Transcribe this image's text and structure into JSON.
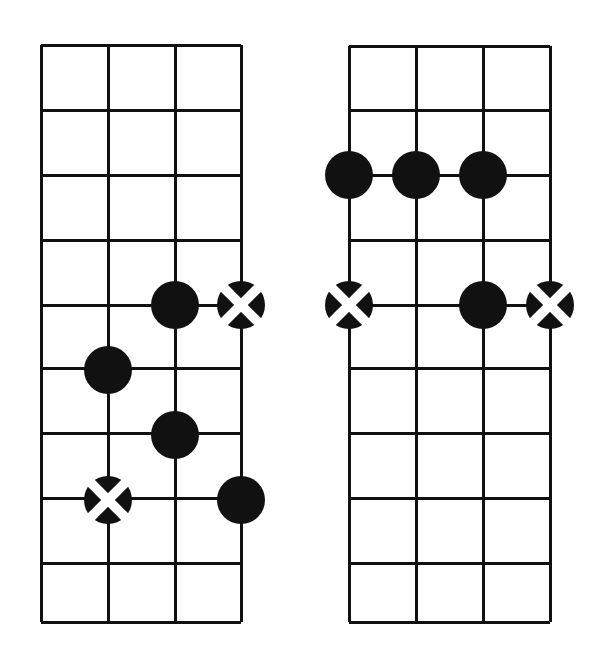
{
  "page": {
    "background_color": "#ffffff",
    "ink_color": "#111111",
    "marker_fill": "#111111",
    "marker_x_color": "#ffffff",
    "width": 603,
    "height": 658
  },
  "chart_data": {
    "type": "diagram",
    "subtype": "chord-chart",
    "grid": {
      "strings": 4,
      "frets": 9,
      "line_color": "#111111",
      "line_width": 3,
      "grid_on": true
    },
    "diagrams": [
      {
        "name": "left-chord-diagram",
        "label": "",
        "origin": {
          "x": 41,
          "y": 45
        },
        "size": {
          "width": 200,
          "height": 577
        },
        "string_x": [
          41,
          108,
          175,
          241
        ],
        "fret_y": [
          45,
          110,
          175,
          240,
          305,
          368,
          433,
          498,
          563,
          622
        ],
        "markers": [
          {
            "id": "L1",
            "string": 3,
            "fret_line": 5,
            "cx": 175,
            "cy": 305,
            "r": 24,
            "type": "filled"
          },
          {
            "id": "L2",
            "string": 4,
            "fret_line": 5,
            "cx": 241,
            "cy": 305,
            "r": 24,
            "type": "crossed"
          },
          {
            "id": "L3",
            "string": 2,
            "fret_line": 6,
            "cx": 108,
            "cy": 370,
            "r": 24,
            "type": "filled"
          },
          {
            "id": "L4",
            "string": 3,
            "fret_line": 7,
            "cx": 175,
            "cy": 435,
            "r": 24,
            "type": "filled"
          },
          {
            "id": "L5",
            "string": 2,
            "fret_line": 8,
            "cx": 108,
            "cy": 500,
            "r": 24,
            "type": "crossed"
          },
          {
            "id": "L6",
            "string": 4,
            "fret_line": 8,
            "cx": 241,
            "cy": 500,
            "r": 24,
            "type": "filled"
          }
        ]
      },
      {
        "name": "right-chord-diagram",
        "label": "",
        "origin": {
          "x": 349,
          "y": 46
        },
        "size": {
          "width": 201,
          "height": 576
        },
        "string_x": [
          349,
          416,
          483,
          550
        ],
        "fret_y": [
          46,
          110,
          175,
          240,
          305,
          368,
          433,
          498,
          563,
          622
        ],
        "markers": [
          {
            "id": "R1",
            "string": 1,
            "fret_line": 3,
            "cx": 349,
            "cy": 175,
            "r": 24,
            "type": "filled"
          },
          {
            "id": "R2",
            "string": 2,
            "fret_line": 3,
            "cx": 416,
            "cy": 175,
            "r": 24,
            "type": "filled"
          },
          {
            "id": "R3",
            "string": 3,
            "fret_line": 3,
            "cx": 483,
            "cy": 175,
            "r": 24,
            "type": "filled"
          },
          {
            "id": "R4",
            "string": 1,
            "fret_line": 5,
            "cx": 349,
            "cy": 305,
            "r": 24,
            "type": "crossed"
          },
          {
            "id": "R5",
            "string": 3,
            "fret_line": 5,
            "cx": 483,
            "cy": 305,
            "r": 24,
            "type": "filled"
          },
          {
            "id": "R6",
            "string": 4,
            "fret_line": 5,
            "cx": 550,
            "cy": 305,
            "r": 24,
            "type": "crossed"
          }
        ]
      }
    ]
  }
}
